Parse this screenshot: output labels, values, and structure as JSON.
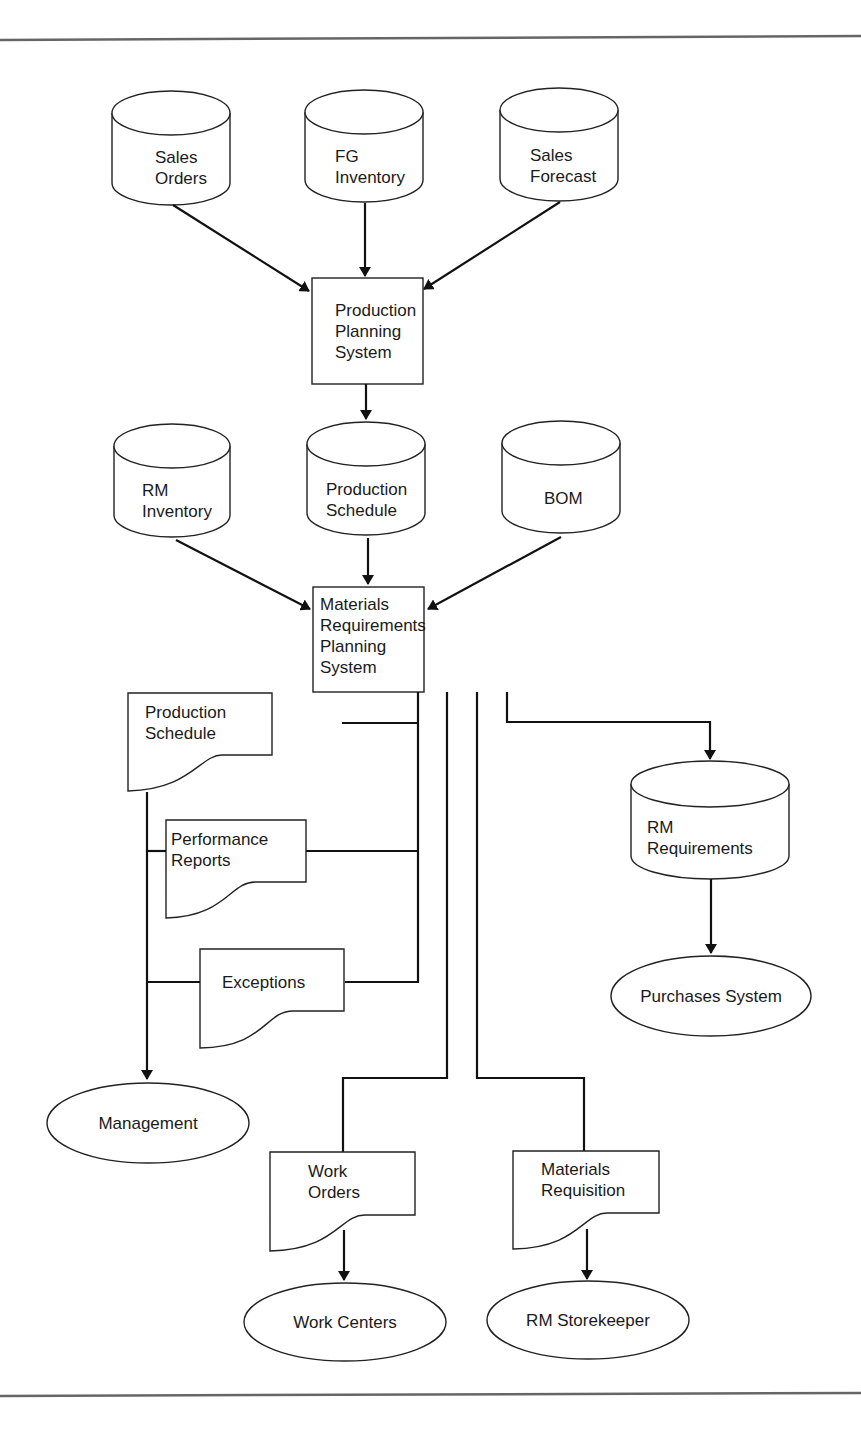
{
  "diagram": {
    "type": "system flowchart",
    "colors": {
      "line": "#111111",
      "rule": "#666666",
      "background": "#ffffff"
    },
    "data_stores_top": [
      {
        "id": "sales-orders",
        "lines": [
          "Sales",
          "Orders"
        ]
      },
      {
        "id": "fg-inventory",
        "lines": [
          "FG",
          "Inventory"
        ]
      },
      {
        "id": "sales-forecast",
        "lines": [
          "Sales",
          "Forecast"
        ]
      }
    ],
    "production_planning": {
      "lines": [
        "Production",
        "Planning",
        "System"
      ]
    },
    "data_stores_mid": [
      {
        "id": "rm-inventory",
        "lines": [
          "RM",
          "Inventory"
        ]
      },
      {
        "id": "production-schedule-store",
        "lines": [
          "Production",
          "Schedule"
        ]
      },
      {
        "id": "bom",
        "lines": [
          "BOM"
        ]
      }
    ],
    "mrp": {
      "lines": [
        "Materials",
        "Requirements",
        "Planning",
        "System"
      ]
    },
    "documents": [
      {
        "id": "production-schedule-doc",
        "lines": [
          "Production",
          "Schedule"
        ]
      },
      {
        "id": "performance-reports",
        "lines": [
          "Performance",
          "Reports"
        ]
      },
      {
        "id": "exceptions",
        "lines": [
          "Exceptions"
        ]
      },
      {
        "id": "work-orders",
        "lines": [
          "Work",
          "Orders"
        ]
      },
      {
        "id": "materials-requisition",
        "lines": [
          "Materials",
          "Requisition"
        ]
      }
    ],
    "rm_requirements": {
      "lines": [
        "RM",
        "Requirements"
      ]
    },
    "terminals": [
      {
        "id": "management",
        "label": "Management"
      },
      {
        "id": "purchases-system",
        "label": "Purchases System"
      },
      {
        "id": "work-centers",
        "label": "Work Centers"
      },
      {
        "id": "rm-storekeeper",
        "label": "RM Storekeeper"
      }
    ],
    "flows": [
      [
        "Sales Orders",
        "Production Planning System"
      ],
      [
        "FG Inventory",
        "Production Planning System"
      ],
      [
        "Sales Forecast",
        "Production Planning System"
      ],
      [
        "Production Planning System",
        "Production Schedule"
      ],
      [
        "RM Inventory",
        "Materials Requirements Planning System"
      ],
      [
        "Production Schedule",
        "Materials Requirements Planning System"
      ],
      [
        "BOM",
        "Materials Requirements Planning System"
      ],
      [
        "Materials Requirements Planning System",
        "Production Schedule (report)"
      ],
      [
        "Materials Requirements Planning System",
        "Performance Reports"
      ],
      [
        "Materials Requirements Planning System",
        "Exceptions"
      ],
      [
        "Reports",
        "Management"
      ],
      [
        "Materials Requirements Planning System",
        "Work Orders"
      ],
      [
        "Work Orders",
        "Work Centers"
      ],
      [
        "Materials Requirements Planning System",
        "Materials Requisition"
      ],
      [
        "Materials Requisition",
        "RM Storekeeper"
      ],
      [
        "Materials Requirements Planning System",
        "RM Requirements"
      ],
      [
        "RM Requirements",
        "Purchases System"
      ]
    ]
  }
}
